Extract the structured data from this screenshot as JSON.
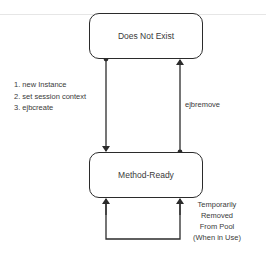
{
  "diagram": {
    "states": {
      "top": {
        "label": "Does Not Exist"
      },
      "bottom": {
        "label": "Method-Ready"
      }
    },
    "transitions": {
      "create": {
        "from": "Does Not Exist",
        "to": "Method-Ready",
        "steps": [
          "1. new Instance",
          "2. set session context",
          "3. ejbcreate"
        ]
      },
      "remove": {
        "from": "Method-Ready",
        "to": "Does Not Exist",
        "label": "ejbremove"
      },
      "self_loop": {
        "from": "Method-Ready",
        "to": "Method-Ready",
        "lines": [
          "Temporarily",
          "Removed",
          "From Pool",
          "(When in Use)"
        ]
      }
    },
    "colors": {
      "stroke": "#2b2b2b",
      "text": "#3a3a3a",
      "background": "#ffffff"
    }
  }
}
